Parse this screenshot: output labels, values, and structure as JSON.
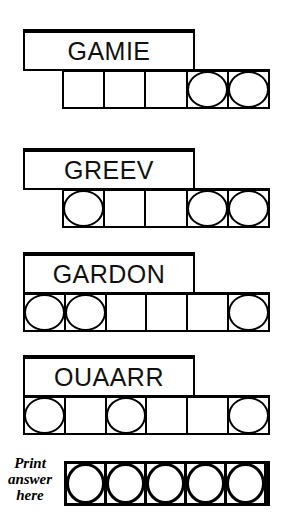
{
  "puzzle": {
    "type": "word-scramble",
    "scrambles": [
      {
        "word": "GAMIE",
        "cell_count": 5,
        "circled_positions": [
          4,
          5
        ],
        "word_box": {
          "left": 23,
          "top": 29,
          "width": 172,
          "height": 42
        },
        "cell_row": {
          "left": 62,
          "top": 69,
          "width": 208,
          "height": 40
        }
      },
      {
        "word": "GREEV",
        "cell_count": 5,
        "circled_positions": [
          1,
          4,
          5
        ],
        "word_box": {
          "left": 23,
          "top": 148,
          "width": 172,
          "height": 42
        },
        "cell_row": {
          "left": 62,
          "top": 188,
          "width": 208,
          "height": 40
        }
      },
      {
        "word": "GARDON",
        "cell_count": 6,
        "circled_positions": [
          1,
          2,
          6
        ],
        "word_box": {
          "left": 23,
          "top": 252,
          "width": 172,
          "height": 42
        },
        "cell_row": {
          "left": 23,
          "top": 292,
          "width": 247,
          "height": 40
        }
      },
      {
        "word": "OUAARR",
        "cell_count": 6,
        "circled_positions": [
          1,
          3,
          6
        ],
        "word_box": {
          "left": 23,
          "top": 355,
          "width": 172,
          "height": 42
        },
        "cell_row": {
          "left": 23,
          "top": 395,
          "width": 247,
          "height": 40
        }
      }
    ],
    "answer": {
      "label_line_1": "Print",
      "label_line_2": "answer",
      "label_line_3": "here",
      "label_box": {
        "left": 0,
        "top": 455,
        "width": 60,
        "height": 50
      },
      "cell_count": 5,
      "circled_positions": [
        1,
        2,
        3,
        4,
        5
      ],
      "cell_row": {
        "left": 64,
        "top": 461,
        "width": 206,
        "height": 45
      }
    },
    "colors": {
      "ink": "#000000",
      "paper": "#ffffff",
      "text": "#111111"
    }
  }
}
